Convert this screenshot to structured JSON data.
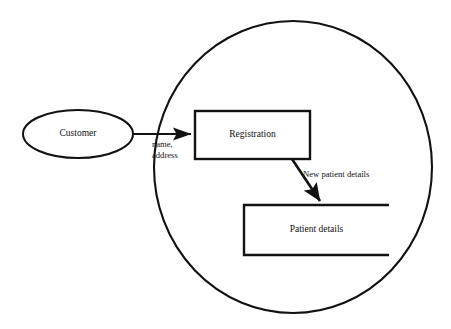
{
  "diagram": {
    "type": "data-flow-diagram",
    "background_color": "#ffffff",
    "stroke_color": "#121212",
    "text_color": "#111111",
    "system_boundary": {
      "shape": "ellipse",
      "cx": 293,
      "cy": 167,
      "rx": 139,
      "ry": 146,
      "stroke_width": 2.1,
      "label": ""
    },
    "nodes": [
      {
        "id": "customer",
        "kind": "external-entity",
        "shape": "ellipse",
        "label": "Customer",
        "cx": 78,
        "cy": 134,
        "rx": 55,
        "ry": 24,
        "font_size": 9.5,
        "stroke_width": 2.0
      },
      {
        "id": "registration",
        "kind": "process",
        "shape": "rectangle",
        "label": "Registration",
        "x": 195,
        "y": 111,
        "width": 115,
        "height": 48,
        "font_size": 9.5,
        "stroke_width": 2.4
      },
      {
        "id": "patient-details",
        "kind": "data-store",
        "shape": "open-rectangle",
        "label": "Patient details",
        "x": 244,
        "y": 205,
        "width": 145,
        "height": 50,
        "font_size": 9.5,
        "stroke_width": 2.4,
        "open_side": "right"
      }
    ],
    "flows": [
      {
        "id": "customer-to-registration",
        "from": "customer",
        "to": "registration",
        "label_lines": [
          "name,",
          "address"
        ],
        "x1": 133,
        "y1": 134,
        "x2": 193,
        "y2": 134,
        "label_x": 152,
        "label_y": 145,
        "font_size": 8.6,
        "stroke_width": 2.2
      },
      {
        "id": "registration-to-patient-details",
        "from": "registration",
        "to": "patient-details",
        "label_lines": [
          "New patient details"
        ],
        "x1": 292,
        "y1": 159,
        "x2": 321,
        "y2": 203,
        "label_x": 303,
        "label_y": 175,
        "font_size": 8.6,
        "stroke_width": 2.6
      }
    ]
  }
}
